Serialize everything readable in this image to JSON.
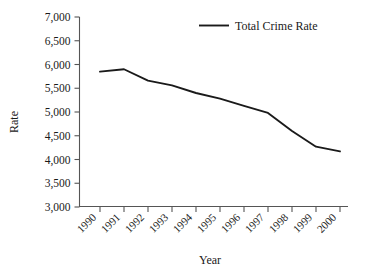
{
  "chart_data": {
    "type": "line",
    "title": "",
    "subtitle": "",
    "xlabel": "Year",
    "ylabel": "Rate",
    "categories": [
      "1990",
      "1991",
      "1992",
      "1993",
      "1994",
      "1995",
      "1996",
      "1997",
      "1998",
      "1999",
      "2000"
    ],
    "x": [
      1990,
      1991,
      1992,
      1993,
      1994,
      1995,
      1996,
      1997,
      1998,
      1999,
      2000
    ],
    "series": [
      {
        "name": "Total Crime Rate",
        "values": [
          5850,
          5900,
          5660,
          5560,
          5400,
          5280,
          5130,
          4980,
          4600,
          4270,
          4170
        ],
        "color": "#1a1a1a"
      }
    ],
    "ylim": [
      3000,
      7000
    ],
    "ytick_labels": [
      "7,000",
      "6,500",
      "6,000",
      "5,500",
      "5,000",
      "4,500",
      "4,000",
      "3,500",
      "3,000"
    ],
    "ytick_values": [
      7000,
      6500,
      6000,
      5500,
      5000,
      4500,
      4000,
      3500,
      3000
    ],
    "xtick_labels": [
      "1990",
      "1991",
      "1992",
      "1993",
      "1994",
      "1995",
      "1996",
      "1997",
      "1998",
      "1999",
      "2000"
    ],
    "xtick_rotation": 45,
    "grid": false,
    "legend_position": "top-right",
    "legend_entries": [
      {
        "label": "Total Crime Rate",
        "marker": "line-swatch",
        "color": "#1a1a1a"
      }
    ],
    "axis_color": "#555555",
    "background_color": "#ffffff"
  }
}
